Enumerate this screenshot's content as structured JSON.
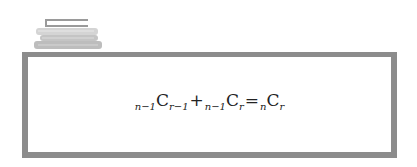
{
  "icon": {
    "name": "book-stack-icon"
  },
  "formula": {
    "text": "n−1Cr−1 + n−1Cr = nCr",
    "terms": [
      {
        "pre": "n−1",
        "base": "C",
        "sub": "r−1"
      },
      {
        "pre": "n−1",
        "base": "C",
        "sub": "r"
      },
      {
        "pre": "n",
        "base": "C",
        "sub": "r"
      }
    ],
    "ops": [
      "+",
      "="
    ]
  },
  "colors": {
    "frame": "#8c8c8c",
    "text": "#222222",
    "background": "#ffffff"
  }
}
